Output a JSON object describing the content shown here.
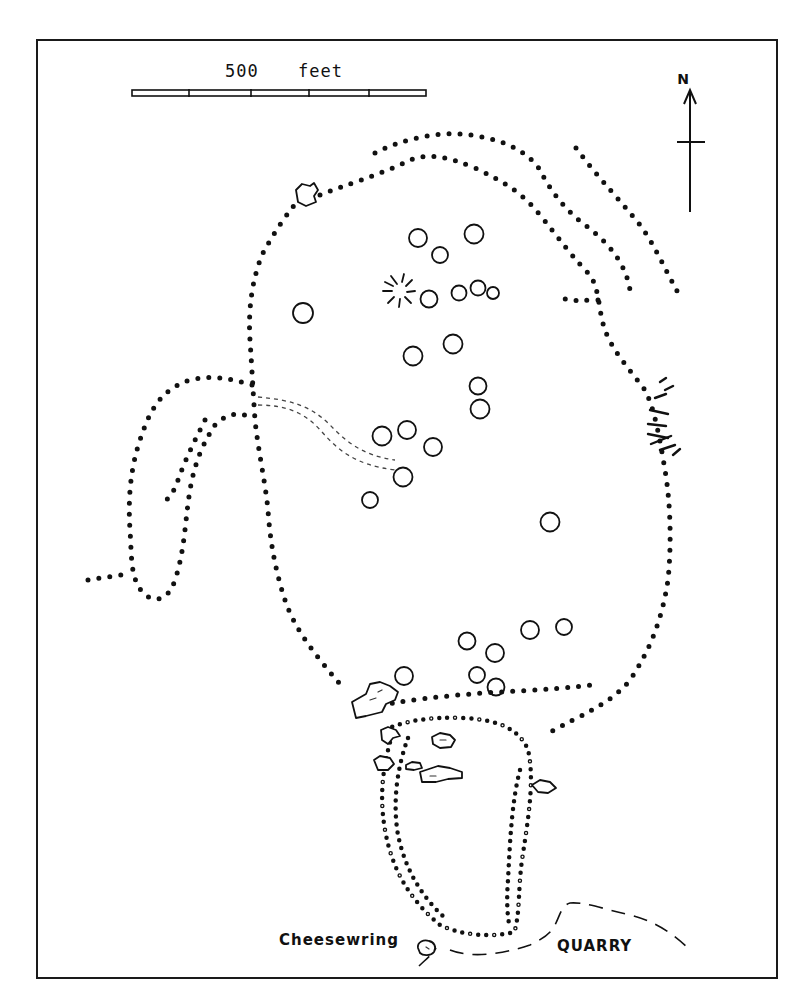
{
  "map": {
    "scale_bar": {
      "label_value": "500",
      "label_unit": "feet",
      "divisions": 5
    },
    "north_arrow": {
      "label": "N"
    },
    "labels": {
      "cheesewring": "Cheesewring",
      "quarry": "QUARRY"
    },
    "colors": {
      "ink": "#111111",
      "paper": "#ffffff"
    },
    "hut_circles": [
      {
        "cx": 418,
        "cy": 238,
        "r": 9
      },
      {
        "cx": 474,
        "cy": 234,
        "r": 9.5
      },
      {
        "cx": 440,
        "cy": 255,
        "r": 8
      },
      {
        "cx": 429,
        "cy": 299,
        "r": 8.5
      },
      {
        "cx": 459,
        "cy": 293,
        "r": 7.5
      },
      {
        "cx": 478,
        "cy": 288,
        "r": 7.5
      },
      {
        "cx": 493,
        "cy": 293,
        "r": 6
      },
      {
        "cx": 303,
        "cy": 313,
        "r": 10
      },
      {
        "cx": 413,
        "cy": 356,
        "r": 9.5
      },
      {
        "cx": 453,
        "cy": 344,
        "r": 9.5
      },
      {
        "cx": 478,
        "cy": 386,
        "r": 8.5
      },
      {
        "cx": 480,
        "cy": 409,
        "r": 9.5
      },
      {
        "cx": 382,
        "cy": 436,
        "r": 9.5
      },
      {
        "cx": 407,
        "cy": 430,
        "r": 9
      },
      {
        "cx": 433,
        "cy": 447,
        "r": 9
      },
      {
        "cx": 403,
        "cy": 477,
        "r": 9.5
      },
      {
        "cx": 370,
        "cy": 500,
        "r": 8
      },
      {
        "cx": 550,
        "cy": 522,
        "r": 9.5
      },
      {
        "cx": 467,
        "cy": 641,
        "r": 8.5
      },
      {
        "cx": 495,
        "cy": 653,
        "r": 9
      },
      {
        "cx": 530,
        "cy": 630,
        "r": 9
      },
      {
        "cx": 564,
        "cy": 627,
        "r": 8
      },
      {
        "cx": 477,
        "cy": 675,
        "r": 8
      },
      {
        "cx": 496,
        "cy": 687,
        "r": 8.5
      },
      {
        "cx": 404,
        "cy": 676,
        "r": 9
      }
    ]
  }
}
